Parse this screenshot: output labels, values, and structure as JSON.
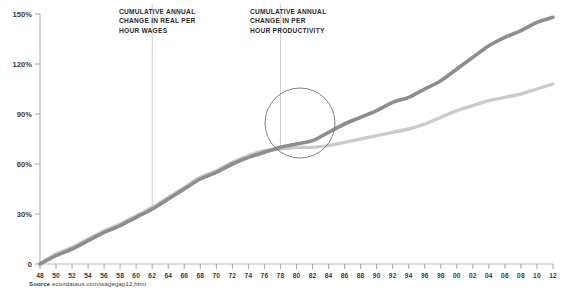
{
  "chart_data": {
    "type": "line",
    "title": "",
    "xlabel": "",
    "ylabel": "",
    "ylim": [
      0,
      150
    ],
    "xlim": [
      1948,
      2012
    ],
    "grid": false,
    "legend_position": "inline-annotations",
    "ytick_labels": [
      "0",
      "30%",
      "60%",
      "90%",
      "120%",
      "150%"
    ],
    "ytick_values": [
      0,
      30,
      60,
      90,
      120,
      150
    ],
    "xtick_labels": [
      "48",
      "50",
      "52",
      "54",
      "56",
      "58",
      "60",
      "62",
      "64",
      "66",
      "68",
      "70",
      "72",
      "74",
      "76",
      "78",
      "80",
      "82",
      "84",
      "86",
      "88",
      "90",
      "92",
      "94",
      "96",
      "98",
      "00",
      "02",
      "04",
      "06",
      "08",
      "10",
      "12"
    ],
    "xtick_values": [
      1948,
      1950,
      1952,
      1954,
      1956,
      1958,
      1960,
      1962,
      1964,
      1966,
      1968,
      1970,
      1972,
      1974,
      1976,
      1978,
      1980,
      1982,
      1984,
      1986,
      1988,
      1990,
      1992,
      1994,
      1996,
      1998,
      2000,
      2002,
      2004,
      2006,
      2008,
      2010,
      2012
    ],
    "x": [
      1948,
      1950,
      1952,
      1954,
      1956,
      1958,
      1960,
      1962,
      1964,
      1966,
      1968,
      1970,
      1972,
      1974,
      1976,
      1978,
      1980,
      1982,
      1984,
      1986,
      1988,
      1990,
      1992,
      1994,
      1996,
      1998,
      2000,
      2002,
      2004,
      2006,
      2008,
      2010,
      2012
    ],
    "series": [
      {
        "name": "Cumulative annual change in per hour productivity",
        "color": "#8d8d8d",
        "values": [
          0,
          5,
          9,
          14,
          19,
          23,
          28,
          33,
          39,
          45,
          51,
          55,
          60,
          64,
          67,
          70,
          72,
          74,
          79,
          84,
          88,
          92,
          97,
          100,
          105,
          110,
          117,
          124,
          131,
          136,
          140,
          145,
          148
        ]
      },
      {
        "name": "Cumulative annual change in real per hour wages",
        "color": "#cbcbcb",
        "values": [
          0,
          6,
          10,
          15,
          20,
          24,
          29,
          34,
          40,
          46,
          52,
          56,
          61,
          65,
          68,
          69,
          70,
          70,
          71,
          73,
          75,
          77,
          79,
          81,
          84,
          88,
          92,
          95,
          98,
          100,
          102,
          105,
          108
        ]
      }
    ],
    "annotations": [
      {
        "id": "wages",
        "text": "Cumulative annual\nchange in real per\nhour wages",
        "leader_x": 1962
      },
      {
        "id": "productivity",
        "text": "Cumulative annual\nchange in per\nhour productivity",
        "leader_x": 1978
      }
    ],
    "callout": {
      "shape": "circle",
      "description": "divergence point"
    }
  },
  "source": {
    "label": "Source",
    "value": "econdataus.com/wagegap12.html"
  }
}
